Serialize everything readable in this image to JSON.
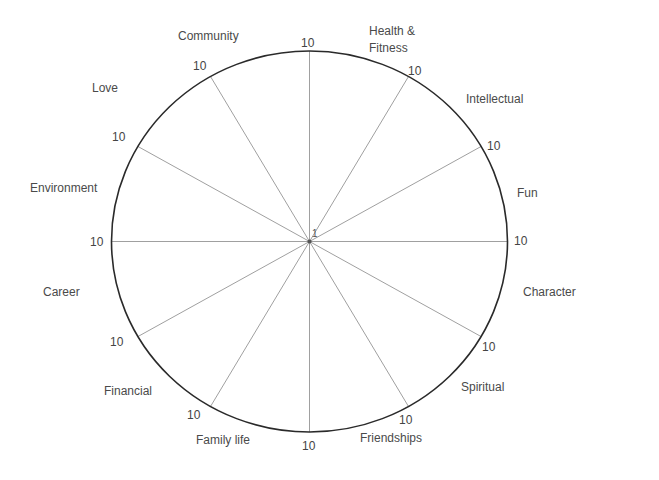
{
  "diagram": {
    "type": "wheel-of-life",
    "center_label": "1",
    "spoke_max_label": "10",
    "colors": {
      "background": "#ffffff",
      "circle_stroke": "#2a2a2a",
      "spoke_stroke": "#a0a0a0",
      "text": "#4a4a4a"
    },
    "segments": [
      {
        "label": "Community",
        "lines": [
          "Community"
        ]
      },
      {
        "label": "Health & Fitness",
        "lines": [
          "Health &",
          "Fitness"
        ]
      },
      {
        "label": "Intellectual",
        "lines": [
          "Intellectual"
        ]
      },
      {
        "label": "Fun",
        "lines": [
          "Fun"
        ]
      },
      {
        "label": "Character",
        "lines": [
          "Character"
        ]
      },
      {
        "label": "Spiritual",
        "lines": [
          "Spiritual"
        ]
      },
      {
        "label": "Friendships",
        "lines": [
          "Friendships"
        ]
      },
      {
        "label": "Family life",
        "lines": [
          "Family life"
        ]
      },
      {
        "label": "Financial",
        "lines": [
          "Financial"
        ]
      },
      {
        "label": "Career",
        "lines": [
          "Career"
        ]
      },
      {
        "label": "Environment",
        "lines": [
          "Environment"
        ]
      },
      {
        "label": "Love",
        "lines": [
          "Love"
        ]
      }
    ],
    "spokes": [
      {
        "angle_deg": 90,
        "end_label": "10"
      },
      {
        "angle_deg": 60,
        "end_label": "10"
      },
      {
        "angle_deg": 30,
        "end_label": "10"
      },
      {
        "angle_deg": 0,
        "end_label": "10"
      },
      {
        "angle_deg": -30,
        "end_label": "10"
      },
      {
        "angle_deg": -60,
        "end_label": "10"
      },
      {
        "angle_deg": -90,
        "end_label": "10"
      },
      {
        "angle_deg": -120,
        "end_label": "10"
      },
      {
        "angle_deg": -150,
        "end_label": "10"
      },
      {
        "angle_deg": 180,
        "end_label": "10"
      },
      {
        "angle_deg": 150,
        "end_label": "10"
      },
      {
        "angle_deg": 120,
        "end_label": "10"
      }
    ]
  }
}
